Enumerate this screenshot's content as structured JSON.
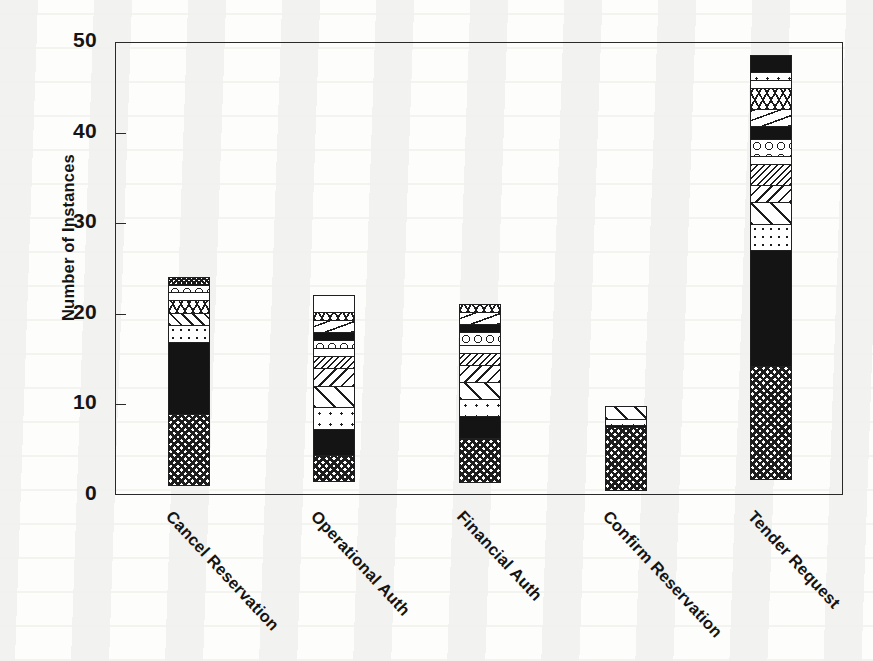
{
  "chart_data": {
    "type": "bar",
    "subtype": "stacked-bar",
    "title": "",
    "xlabel": "",
    "ylabel": "Number of Instances",
    "ylim": [
      0,
      50
    ],
    "yticks": [
      0,
      10,
      20,
      30,
      40,
      50
    ],
    "ytick_labels": [
      "0",
      "10",
      "20",
      "30",
      "40",
      "50"
    ],
    "grid": false,
    "legend": "none",
    "categories": [
      "Cancel Reservation",
      "Operational Auth",
      "Financial Auth",
      "Confirm Reservation",
      "Tender Request"
    ],
    "totals": [
      24,
      22,
      21,
      9.7,
      48.5
    ],
    "stacks": [
      {
        "category": "Cancel Reservation",
        "total": 24,
        "segments": [
          {
            "value": 8,
            "pattern": "checker"
          },
          {
            "value": 8,
            "pattern": "solid-black"
          },
          {
            "value": 2,
            "pattern": "dots-diag"
          },
          {
            "value": 1.5,
            "pattern": "hatch-right"
          },
          {
            "value": 1.5,
            "pattern": "hatch-vee"
          },
          {
            "value": 1,
            "pattern": "white"
          },
          {
            "value": 1,
            "pattern": "circles"
          },
          {
            "value": 1,
            "pattern": "checker-dense"
          }
        ]
      },
      {
        "category": "Operational Auth",
        "total": 22,
        "segments": [
          {
            "value": 3,
            "pattern": "checker"
          },
          {
            "value": 3,
            "pattern": "solid-black"
          },
          {
            "value": 2.5,
            "pattern": "dots-sparse"
          },
          {
            "value": 2.5,
            "pattern": "hatch-wide"
          },
          {
            "value": 2,
            "pattern": "hatch-left"
          },
          {
            "value": 1.5,
            "pattern": "hatch-dense"
          },
          {
            "value": 1,
            "pattern": "white"
          },
          {
            "value": 1,
            "pattern": "circles"
          },
          {
            "value": 1,
            "pattern": "solid-black"
          },
          {
            "value": 1.5,
            "pattern": "dash"
          },
          {
            "value": 1,
            "pattern": "hatch-vee"
          },
          {
            "value": 2,
            "pattern": "white"
          }
        ]
      },
      {
        "category": "Financial Auth",
        "total": 21,
        "segments": [
          {
            "value": 5,
            "pattern": "checker"
          },
          {
            "value": 2.5,
            "pattern": "solid-black"
          },
          {
            "value": 2,
            "pattern": "dots-sparse"
          },
          {
            "value": 2,
            "pattern": "hatch-wide"
          },
          {
            "value": 2,
            "pattern": "hatch-left"
          },
          {
            "value": 1.5,
            "pattern": "hatch-dense"
          },
          {
            "value": 1,
            "pattern": "white"
          },
          {
            "value": 1.5,
            "pattern": "circles"
          },
          {
            "value": 1,
            "pattern": "solid-black"
          },
          {
            "value": 1.5,
            "pattern": "dash"
          },
          {
            "value": 1,
            "pattern": "hatch-vee"
          }
        ]
      },
      {
        "category": "Confirm Reservation",
        "total": 9.7,
        "segments": [
          {
            "value": 7,
            "pattern": "checker"
          },
          {
            "value": 0.4,
            "pattern": "solid-black"
          },
          {
            "value": 0.8,
            "pattern": "dots-sparse"
          },
          {
            "value": 1.5,
            "pattern": "hatch-wide"
          }
        ]
      },
      {
        "category": "Tender Request",
        "total": 48.5,
        "segments": [
          {
            "value": 12.5,
            "pattern": "checker"
          },
          {
            "value": 13,
            "pattern": "solid-black"
          },
          {
            "value": 3,
            "pattern": "dots-diag"
          },
          {
            "value": 2.5,
            "pattern": "hatch-wide"
          },
          {
            "value": 2,
            "pattern": "hatch-left"
          },
          {
            "value": 2.5,
            "pattern": "hatch-dense"
          },
          {
            "value": 1,
            "pattern": "white"
          },
          {
            "value": 2,
            "pattern": "circles"
          },
          {
            "value": 1.5,
            "pattern": "solid-black"
          },
          {
            "value": 2,
            "pattern": "dash"
          },
          {
            "value": 2.5,
            "pattern": "hatch-vee"
          },
          {
            "value": 1,
            "pattern": "white"
          },
          {
            "value": 1,
            "pattern": "dots-sparse"
          },
          {
            "value": 2,
            "pattern": "solid-black"
          }
        ]
      }
    ]
  },
  "axes": {
    "y_title": "Number of Instances",
    "y_ticks": [
      "0",
      "10",
      "20",
      "30",
      "40",
      "50"
    ]
  },
  "colors": {
    "ink": "#141414",
    "frame": "#2a2a2a",
    "paper": "#fdfdfb"
  }
}
